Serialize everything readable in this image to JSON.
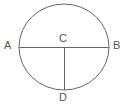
{
  "figure": {
    "background_color": "#ffffff",
    "stroke_color": "#666666",
    "label_color": "#555555",
    "stroke_width": 1,
    "canvas": {
      "width": 127,
      "height": 107
    },
    "circle": {
      "name": "circle",
      "center_x": 64,
      "center_y": 47,
      "radius_x": 45,
      "radius_y": 43
    },
    "segments": [
      {
        "name": "diameter-AB",
        "from": "A",
        "to": "B",
        "x1": 19,
        "y1": 47,
        "x2": 109,
        "y2": 47
      },
      {
        "name": "radius-CD",
        "from": "C",
        "to": "D",
        "x1": 64,
        "y1": 47,
        "x2": 64,
        "y2": 90
      }
    ],
    "points": [
      {
        "id": "A",
        "label": "A",
        "position": "left-end-of-diameter",
        "x": 19,
        "y": 47
      },
      {
        "id": "B",
        "label": "B",
        "position": "right-end-of-diameter",
        "x": 109,
        "y": 47
      },
      {
        "id": "C",
        "label": "C",
        "position": "center",
        "x": 64,
        "y": 47
      },
      {
        "id": "D",
        "label": "D",
        "position": "bottom-of-circle",
        "x": 64,
        "y": 90
      }
    ]
  }
}
